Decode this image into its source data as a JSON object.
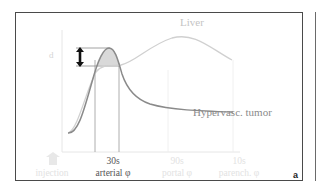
{
  "figure": {
    "panel_letter": "a",
    "curves": {
      "liver_label": "Liver",
      "tumor_label": "Hypervasc. tumor"
    },
    "y_axis_label": "d",
    "x_axis": {
      "injection_label": "injection",
      "ticks": [
        {
          "time": "30s",
          "phase": "arterial φ"
        },
        {
          "time": "90s",
          "phase": "portal φ"
        },
        {
          "time": "10s",
          "phase": "parench. φ"
        }
      ]
    },
    "colors": {
      "frame": "#4a4a4a",
      "tumor_curve": "#8a8a8a",
      "liver_curve": "#d0d0d0",
      "shaded_area": "#d8d8d8",
      "arrow": "#111111"
    }
  }
}
